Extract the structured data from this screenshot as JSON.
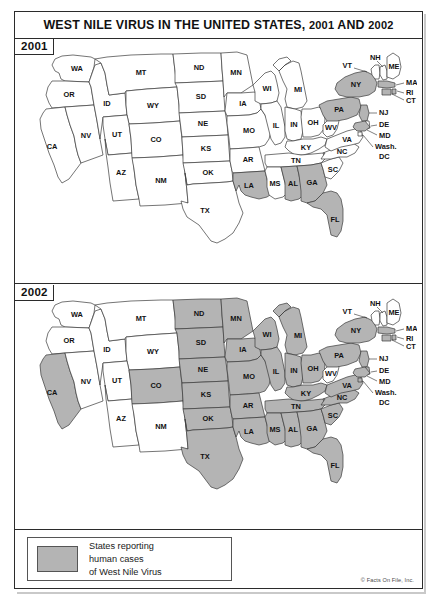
{
  "figure": {
    "title_main": "WEST NILE VIRUS IN THE UNITED STATES,",
    "title_year1": "2001",
    "title_and": "AND",
    "title_year2": "2002",
    "credit": "© Facts On File, Inc."
  },
  "legend": {
    "line1": "States reporting",
    "line2": "human cases",
    "line3": "of West Nile Virus",
    "swatch_color": "#b4b4b4",
    "unshaded_color": "#ffffff"
  },
  "panels": [
    {
      "year": "2001"
    },
    {
      "year": "2002"
    }
  ],
  "chart_data": {
    "type": "map",
    "title": "WEST NILE VIRUS IN THE UNITED STATES, 2001 AND 2002",
    "legend": "States reporting human cases of West Nile Virus",
    "shaded_color": "#b4b4b4",
    "unshaded_color": "#ffffff",
    "maps": [
      {
        "year": "2001",
        "reporting_states": [
          "NY",
          "PA",
          "NJ",
          "CT",
          "RI",
          "MA",
          "MD",
          "LA",
          "AL",
          "GA",
          "FL"
        ],
        "reporting_count": 11,
        "non_reporting_states": [
          "WA",
          "OR",
          "CA",
          "NV",
          "ID",
          "MT",
          "WY",
          "UT",
          "AZ",
          "CO",
          "NM",
          "ND",
          "SD",
          "NE",
          "KS",
          "OK",
          "TX",
          "MN",
          "IA",
          "MO",
          "AR",
          "WI",
          "IL",
          "MI",
          "IN",
          "OH",
          "KY",
          "TN",
          "MS",
          "WV",
          "VA",
          "NC",
          "SC",
          "VT",
          "NH",
          "ME",
          "DE",
          "DC"
        ]
      },
      {
        "year": "2002",
        "reporting_states": [
          "CA",
          "ND",
          "SD",
          "NE",
          "KS",
          "OK",
          "TX",
          "CO",
          "MN",
          "IA",
          "MO",
          "AR",
          "LA",
          "MS",
          "AL",
          "GA",
          "FL",
          "SC",
          "NC",
          "TN",
          "KY",
          "WI",
          "IL",
          "MI",
          "IN",
          "OH",
          "PA",
          "NY",
          "NJ",
          "CT",
          "RI",
          "MA",
          "VA",
          "MD",
          "DE",
          "DC"
        ],
        "reporting_count": 36,
        "non_reporting_states": [
          "WA",
          "OR",
          "ID",
          "MT",
          "WY",
          "NV",
          "UT",
          "AZ",
          "NM",
          "WV",
          "VT",
          "NH",
          "ME"
        ]
      }
    ],
    "state_labels": [
      "WA",
      "OR",
      "CA",
      "NV",
      "ID",
      "MT",
      "WY",
      "UT",
      "AZ",
      "CO",
      "NM",
      "ND",
      "SD",
      "NE",
      "KS",
      "OK",
      "TX",
      "MN",
      "IA",
      "MO",
      "AR",
      "LA",
      "WI",
      "IL",
      "MI",
      "IN",
      "OH",
      "KY",
      "TN",
      "MS",
      "AL",
      "GA",
      "FL",
      "SC",
      "NC",
      "VA",
      "WV",
      "PA",
      "NY",
      "VT",
      "NH",
      "ME",
      "MA",
      "RI",
      "CT",
      "NJ",
      "DE",
      "MD",
      "Wash. DC"
    ]
  }
}
